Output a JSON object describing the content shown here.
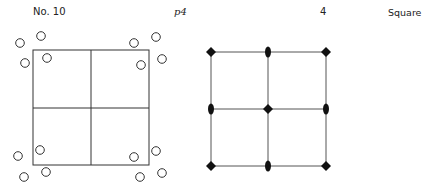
{
  "header": {
    "number": "No. 10",
    "group_symbol": "p4",
    "rotation_order": "4",
    "lattice_type": "Square"
  },
  "motif_diagram": {
    "cell": {
      "x": 33,
      "y": 50,
      "width": 116,
      "height": 115
    },
    "dividers": {
      "vertical_x": 91,
      "horizontal_y": 108
    },
    "circle_radius": 4.3,
    "circles": [
      {
        "cx": 20,
        "cy": 43
      },
      {
        "cx": 41,
        "cy": 36
      },
      {
        "cx": 25,
        "cy": 63
      },
      {
        "cx": 47,
        "cy": 58
      },
      {
        "cx": 134,
        "cy": 43
      },
      {
        "cx": 156,
        "cy": 37
      },
      {
        "cx": 162,
        "cy": 59
      },
      {
        "cx": 141,
        "cy": 65
      },
      {
        "cx": 18,
        "cy": 156
      },
      {
        "cx": 40,
        "cy": 150
      },
      {
        "cx": 24,
        "cy": 177
      },
      {
        "cx": 46,
        "cy": 172
      },
      {
        "cx": 134,
        "cy": 157
      },
      {
        "cx": 156,
        "cy": 151
      },
      {
        "cx": 162,
        "cy": 173
      },
      {
        "cx": 140,
        "cy": 177
      }
    ]
  },
  "symmetry_diagram": {
    "grid_x": [
      211,
      268,
      326
    ],
    "grid_y": [
      52,
      109,
      166
    ],
    "fourfold_points": [
      {
        "x": 211,
        "y": 52
      },
      {
        "x": 326,
        "y": 52
      },
      {
        "x": 268,
        "y": 109
      },
      {
        "x": 211,
        "y": 166
      },
      {
        "x": 326,
        "y": 166
      }
    ],
    "twofold_points": [
      {
        "x": 268,
        "y": 52
      },
      {
        "x": 211,
        "y": 109
      },
      {
        "x": 326,
        "y": 109
      },
      {
        "x": 268,
        "y": 166
      }
    ]
  }
}
